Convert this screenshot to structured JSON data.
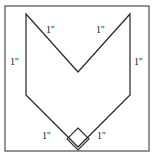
{
  "figure": {
    "kind": "geometry-diagram",
    "canvas": {
      "width": 156,
      "height": 161
    },
    "colors": {
      "background": "#ffffff",
      "frame_stroke": "#5a5a5a",
      "shape_stroke": "#2b2b2b",
      "shape_fill": "#ffffff",
      "label_text": "#1c1c1c"
    },
    "frame": {
      "x": 5,
      "y": 6,
      "width": 144,
      "height": 145
    },
    "shape": {
      "points": "26,14 78,72 130,14 130,95 78,147 26,95",
      "vertices": [
        {
          "name": "top-left-tip",
          "x": 26,
          "y": 14
        },
        {
          "name": "inner-notch-bottom",
          "x": 78,
          "y": 72
        },
        {
          "name": "top-right-tip",
          "x": 130,
          "y": 14
        },
        {
          "name": "right-lower-corner",
          "x": 130,
          "y": 95
        },
        {
          "name": "bottom-point",
          "x": 78,
          "y": 147
        },
        {
          "name": "left-lower-corner",
          "x": 26,
          "y": 95
        }
      ]
    },
    "right_angle_marker": {
      "at_vertex": "bottom-point",
      "points": "78,128 89,139 78,150 67,139"
    },
    "labels": [
      {
        "id": "label-top-left",
        "text": "1''",
        "x": 46,
        "y": 25
      },
      {
        "id": "label-top-right",
        "text": "1''",
        "x": 96,
        "y": 25
      },
      {
        "id": "label-left-side",
        "text": "1''",
        "x": 10,
        "y": 57
      },
      {
        "id": "label-right-side",
        "text": "1''",
        "x": 134,
        "y": 57
      },
      {
        "id": "label-bottom-left",
        "text": "1''",
        "x": 42,
        "y": 131
      },
      {
        "id": "label-bottom-right",
        "text": "1''",
        "x": 97,
        "y": 131
      }
    ]
  }
}
